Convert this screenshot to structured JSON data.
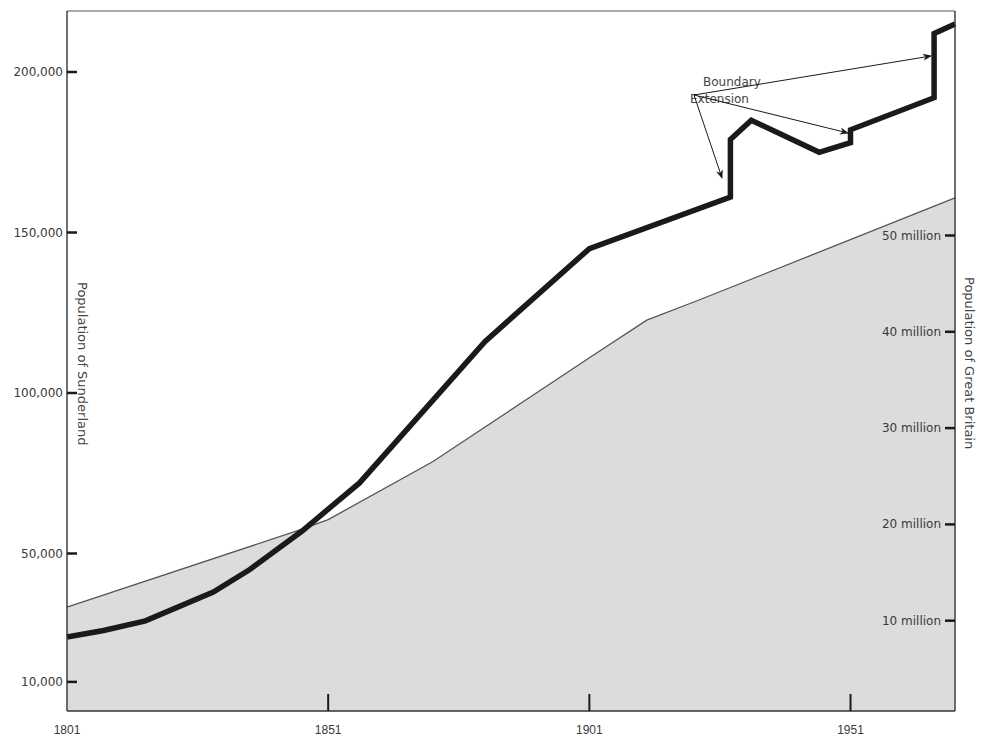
{
  "chart_data": {
    "type": "line",
    "title": "",
    "xlabel": "",
    "ylabel_left": "Population of Sunderland",
    "ylabel_right": "Population of Great Britain",
    "x_ticks": [
      1801,
      1851,
      1901,
      1951
    ],
    "x_tick_labels": [
      "1801",
      "1851",
      "1901",
      "1951"
    ],
    "xlim": [
      1801,
      1971
    ],
    "left_axis": {
      "ticks": [
        10000,
        50000,
        100000,
        150000,
        200000
      ],
      "tick_labels": [
        "10,000",
        "50,000",
        "100,000",
        "150,000",
        "200,000"
      ],
      "ylim": [
        0,
        219000
      ]
    },
    "right_axis": {
      "ticks": [
        10,
        20,
        30,
        40,
        50
      ],
      "tick_labels": [
        "10 million",
        "20 million",
        "30 million",
        "40 million",
        "50 million"
      ],
      "unit": "million",
      "ylim": [
        0,
        73
      ]
    },
    "grid": false,
    "series": [
      {
        "name": "Population of Sunderland",
        "axis": "left",
        "style": "thick black line",
        "color": "#1a1a1a",
        "x": [
          1801,
          1808,
          1816,
          1829,
          1836,
          1846,
          1857,
          1881,
          1901,
          1928,
          1928,
          1932,
          1945,
          1951,
          1951,
          1967,
          1967,
          1971
        ],
        "values": [
          24000,
          26000,
          29000,
          38000,
          45000,
          57000,
          72000,
          116000,
          145000,
          161000,
          179000,
          185000,
          175000,
          178000,
          182000,
          192000,
          212000,
          215000
        ]
      },
      {
        "name": "Population of Great Britain",
        "axis": "right",
        "style": "grey filled area",
        "color": "#d9d9d9",
        "x": [
          1801,
          1846,
          1851,
          1871,
          1901,
          1912,
          1922,
          1971
        ],
        "values": [
          11.4,
          19.5,
          20.5,
          26.5,
          37.3,
          41.2,
          43.3,
          53.9
        ]
      }
    ],
    "annotations": [
      {
        "text": "Boundary Extension",
        "lines": [
          "Boundary",
          "Extension"
        ],
        "arrows_to": [
          1928,
          1951,
          1967
        ]
      }
    ]
  }
}
